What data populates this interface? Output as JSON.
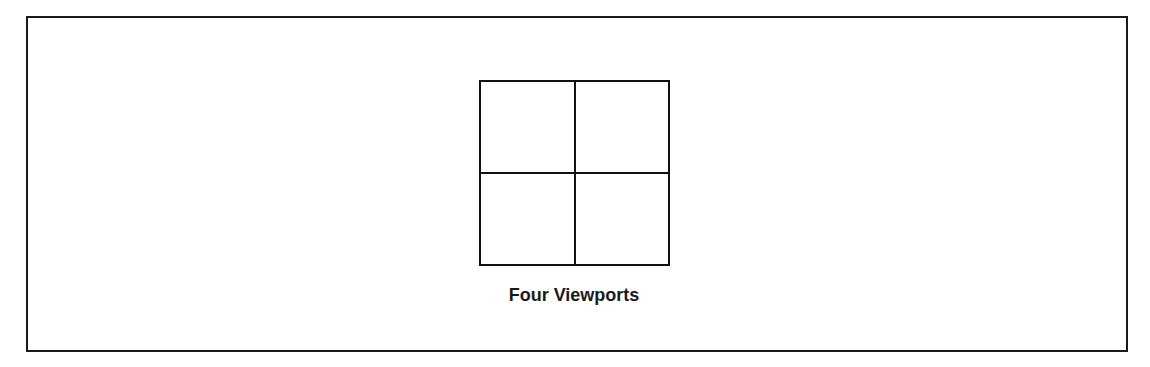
{
  "figure": {
    "layout_name": "Four Viewports",
    "viewports": [
      {
        "position": "top-left"
      },
      {
        "position": "top-right"
      },
      {
        "position": "bottom-left"
      },
      {
        "position": "bottom-right"
      }
    ],
    "rows": 2,
    "columns": 2
  },
  "colors": {
    "line": "#111111",
    "background": "#ffffff"
  }
}
